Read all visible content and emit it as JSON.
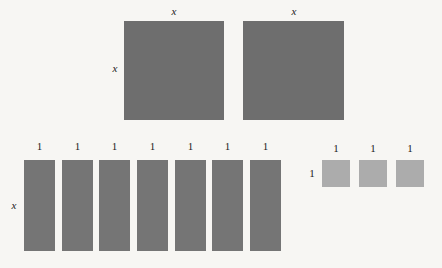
{
  "diagram": {
    "background_color": "#f7f6f3",
    "colors": {
      "big_square": "#6e6e6e",
      "tall_bar": "#757575",
      "small_square": "#acacac",
      "label": "#1c1c1c"
    },
    "big_squares": [
      {
        "name": "x-squared-tile-1",
        "top_label": "x",
        "left_label": "x",
        "x": 124,
        "y": 21,
        "w": 100,
        "h": 99
      },
      {
        "name": "x-squared-tile-2",
        "top_label": "x",
        "left_label": "",
        "x": 243,
        "y": 21,
        "w": 101,
        "h": 99
      }
    ],
    "tall_bars": {
      "row_left_label": "x",
      "top_labels": [
        "1",
        "1",
        "1",
        "1",
        "1",
        "1",
        "1"
      ],
      "x_positions": [
        24,
        62,
        99,
        137,
        175,
        212,
        250
      ],
      "y": 160,
      "w": 31,
      "h": 91
    },
    "small_squares": {
      "row_left_label": "1",
      "top_labels": [
        "1",
        "1",
        "1"
      ],
      "x_positions": [
        322,
        359,
        396
      ],
      "y": 160,
      "w": 28,
      "h": 27
    }
  }
}
